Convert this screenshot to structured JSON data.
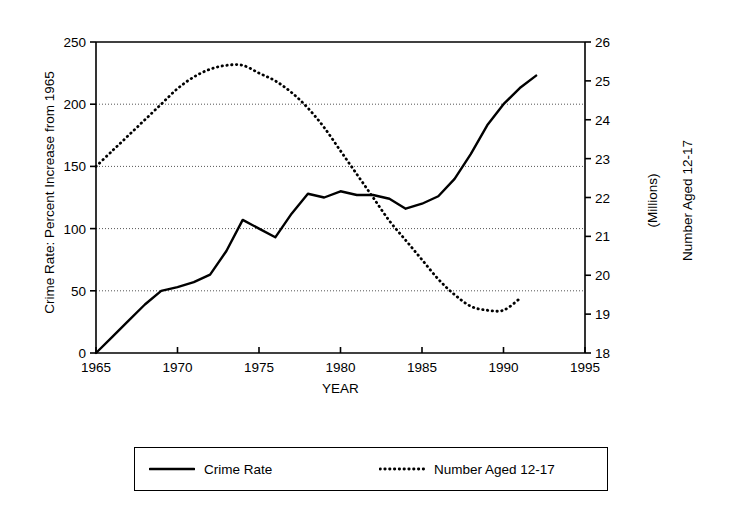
{
  "chart_data": {
    "type": "line",
    "title": "",
    "xlabel": "YEAR",
    "ylabel_left": "Crime Rate: Percent Increase from 1965",
    "ylabel_right": "Number Aged 12-17",
    "ylabel_right_sub": "(Millions)",
    "xlim": [
      1965,
      1995
    ],
    "ylim_left": [
      0,
      250
    ],
    "ylim_right": [
      18,
      26
    ],
    "xticks": [
      1965,
      1970,
      1975,
      1980,
      1985,
      1990,
      1995
    ],
    "xtick_labels": [
      "1965",
      "1970",
      "1975",
      "1980",
      "1985",
      "1990",
      "1995"
    ],
    "yticks_left": [
      0,
      50,
      100,
      150,
      200,
      250
    ],
    "ytick_labels_left": [
      "0",
      "50",
      "100",
      "150",
      "200",
      "250"
    ],
    "yticks_right": [
      18,
      19,
      20,
      21,
      22,
      23,
      24,
      25,
      26
    ],
    "ytick_labels_right": [
      "18",
      "19",
      "20",
      "21",
      "22",
      "23",
      "24",
      "25",
      "26"
    ],
    "grid": true,
    "gridlines_left": [
      50,
      100,
      150,
      200
    ],
    "legend_position": "below-plot",
    "series": [
      {
        "name": "Crime Rate",
        "axis": "left",
        "style": "solid",
        "color": "#000000",
        "x": [
          1965,
          1966,
          1967,
          1968,
          1969,
          1970,
          1971,
          1972,
          1973,
          1974,
          1975,
          1976,
          1977,
          1978,
          1979,
          1980,
          1981,
          1982,
          1983,
          1984,
          1985,
          1986,
          1987,
          1988,
          1989,
          1990,
          1991,
          1992
        ],
        "values": [
          0,
          13,
          26,
          39,
          50,
          53,
          57,
          63,
          82,
          107,
          100,
          93,
          112,
          128,
          125,
          130,
          127,
          127,
          124,
          116,
          120,
          126,
          140,
          160,
          183,
          200,
          213,
          223
        ]
      },
      {
        "name": "Number Aged 12-17",
        "axis": "right",
        "style": "dotted",
        "color": "#000000",
        "x": [
          1965,
          1966,
          1967,
          1968,
          1969,
          1970,
          1971,
          1972,
          1973,
          1974,
          1975,
          1976,
          1977,
          1978,
          1979,
          1980,
          1981,
          1982,
          1983,
          1984,
          1985,
          1986,
          1987,
          1988,
          1989,
          1990,
          1991
        ],
        "values": [
          22.8,
          23.2,
          23.6,
          24.0,
          24.4,
          24.8,
          25.1,
          25.3,
          25.4,
          25.4,
          25.2,
          25.0,
          24.7,
          24.3,
          23.8,
          23.2,
          22.6,
          22.0,
          21.4,
          20.9,
          20.4,
          19.9,
          19.5,
          19.2,
          19.1,
          19.1,
          19.4
        ]
      }
    ]
  },
  "legend": {
    "items": [
      {
        "label": "Crime Rate",
        "style": "solid"
      },
      {
        "label": "Number Aged 12-17",
        "style": "dotted"
      }
    ]
  }
}
